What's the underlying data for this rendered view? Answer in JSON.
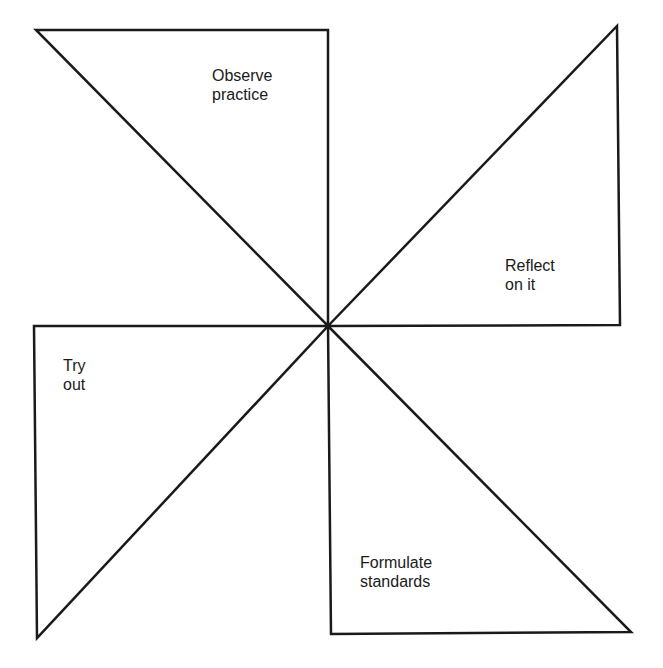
{
  "diagram": {
    "type": "pinwheel",
    "stroke_color": "#1a1a1a",
    "blades": [
      {
        "id": "observe",
        "line1": "Observe",
        "line2": "practice",
        "points": "36,30 328,30 328,326",
        "label_x": 212,
        "label_y": 66
      },
      {
        "id": "reflect",
        "line1": "Reflect",
        "line2": "on it",
        "points": "328,326 617,26 620,325",
        "label_x": 505,
        "label_y": 256
      },
      {
        "id": "formulate",
        "line1": "Formulate",
        "line2": "standards",
        "points": "328,326 631,632 331,634",
        "label_x": 360,
        "label_y": 553
      },
      {
        "id": "tryout",
        "line1": "Try",
        "line2": "out",
        "points": "328,326 34,326 37,638",
        "label_x": 63,
        "label_y": 356
      }
    ]
  }
}
